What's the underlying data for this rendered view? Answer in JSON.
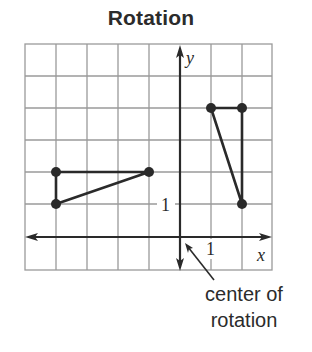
{
  "title": "Rotation",
  "axes": {
    "x_label": "x",
    "y_label": "y",
    "x_tick_label": "1",
    "y_tick_label": "1"
  },
  "grid": {
    "x_min": -5,
    "x_max": 3,
    "y_min": -1,
    "y_max": 6,
    "unit": 1
  },
  "figures": [
    {
      "name": "original-triangle",
      "vertices": [
        [
          -4,
          2
        ],
        [
          -1,
          2
        ],
        [
          -4,
          1
        ]
      ]
    },
    {
      "name": "rotated-triangle",
      "vertices": [
        [
          1,
          4
        ],
        [
          2,
          4
        ],
        [
          2,
          1
        ]
      ]
    }
  ],
  "annotation": {
    "line1": "center of",
    "line2": "rotation",
    "points_to": [
      0,
      0
    ]
  },
  "colors": {
    "grid": "#9a9a9a",
    "axis": "#2a2a2a",
    "figure": "#2a2a2a",
    "text": "#2b2b2b"
  }
}
